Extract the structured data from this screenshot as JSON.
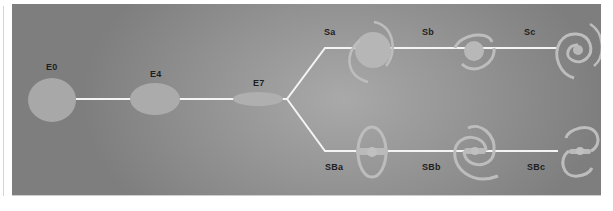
{
  "diagram": {
    "title": "",
    "colors": {
      "background_center": "#a9a9a9",
      "background_edge": "#7e7e7e",
      "connector": "#f4f4f4",
      "galaxy_fill": "#b4b4b4",
      "galaxy_arm": "#bdbdbd",
      "label": "#1e1e1e"
    },
    "elliptical": [
      {
        "label": "E0"
      },
      {
        "label": "E4"
      },
      {
        "label": "E7"
      }
    ],
    "spiral_branch": [
      {
        "label": "Sa"
      },
      {
        "label": "Sb"
      },
      {
        "label": "Sc"
      }
    ],
    "barred_spiral_branch": [
      {
        "label": "SBa"
      },
      {
        "label": "SBb"
      },
      {
        "label": "SBc"
      }
    ]
  }
}
